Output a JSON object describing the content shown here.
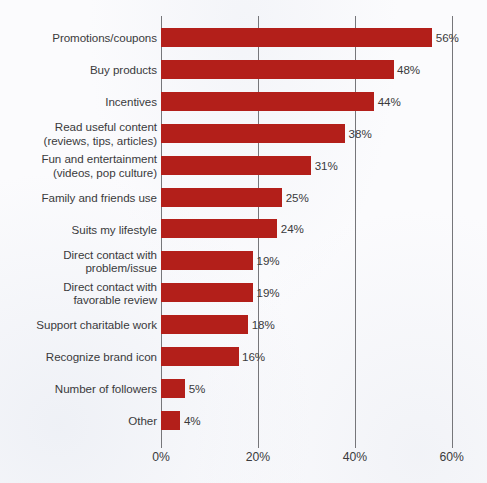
{
  "chart_data": {
    "type": "bar",
    "orientation": "horizontal",
    "title": "",
    "subtitle": "",
    "xlabel": "",
    "ylabel": "",
    "xlim": [
      0,
      60
    ],
    "grid": "vertical",
    "legend": "none",
    "value_suffix": "%",
    "categories": [
      "Promotions/coupons",
      "Buy products",
      "Incentives",
      "Read useful content\n(reviews, tips, articles)",
      "Fun and entertainment\n(videos, pop culture)",
      "Family and friends use",
      "Suits my lifestyle",
      "Direct contact with\nproblem/issue",
      "Direct contact with\nfavorable review",
      "Support charitable work",
      "Recognize brand icon",
      "Number of followers",
      "Other"
    ],
    "values": [
      56,
      48,
      44,
      38,
      31,
      25,
      24,
      19,
      19,
      18,
      16,
      5,
      4
    ],
    "data_labels": [
      "56%",
      "48%",
      "44%",
      "38%",
      "31%",
      "25%",
      "24%",
      "19%",
      "19%",
      "18%",
      "16%",
      "5%",
      "4%"
    ],
    "xticks": [
      0,
      20,
      40,
      60
    ],
    "xtick_labels": [
      "0%",
      "20%",
      "40%",
      "60%"
    ],
    "colors": {
      "bar": "#b31f1a",
      "text": "#3a3a3c",
      "gridline": "#76767a",
      "background": "#fbfbfd"
    }
  }
}
